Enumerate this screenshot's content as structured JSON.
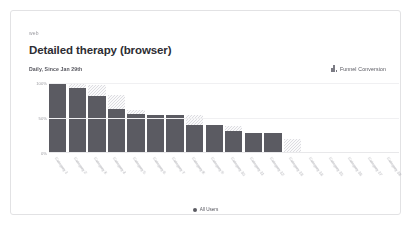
{
  "card": {
    "breadcrumb": "web",
    "title": "Detailed therapy (browser)",
    "subtitle": "Daily, Since Jan 29th"
  },
  "controls": {
    "funnel_label": "Funnel Conversion",
    "funnel_icon": "bar-chart-icon"
  },
  "legend": {
    "series_label": "All Users",
    "marker_color": "#5b5b62"
  },
  "colors": {
    "bar_solid": "#5b5b62",
    "bar_hatch": "#dddde1",
    "card_border": "#e2e2e4",
    "grid": "#f0f0f2",
    "title_text": "#2d2d33",
    "muted_text": "#9b9ba1"
  },
  "chart_data": {
    "type": "bar",
    "title": "Detailed therapy (browser)",
    "subtitle": "Daily, Since Jan 29th",
    "xlabel": "",
    "ylabel": "",
    "ylim": [
      0,
      100
    ],
    "yticks": [
      "100%",
      "50%",
      "0%"
    ],
    "ytick_values": [
      100,
      50,
      0
    ],
    "grid": true,
    "legend_position": "bottom",
    "series": [
      {
        "name": "All Users",
        "values": [
          100,
          93,
          81,
          63,
          56,
          54,
          54,
          40,
          40,
          31,
          28,
          28,
          0,
          0,
          0,
          0,
          0,
          0
        ]
      },
      {
        "name": "Funnel Conversion",
        "values": [
          100,
          100,
          97,
          83,
          62,
          54,
          54,
          55,
          40,
          39,
          28,
          28,
          20,
          0,
          0,
          0,
          0,
          0
        ]
      }
    ],
    "categories": [
      "Category 1",
      "Category 2",
      "Category 3",
      "Category 4",
      "Category 5",
      "Category 6",
      "Category 7",
      "Category 8",
      "Category 9",
      "Category 10",
      "Category 11",
      "Category 12",
      "Category 13",
      "Category 14",
      "Category 15",
      "Category 16",
      "Category 17",
      "Category 18"
    ]
  }
}
